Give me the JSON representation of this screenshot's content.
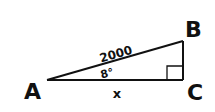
{
  "diagram": {
    "type": "right-triangle",
    "vertices": {
      "A": "A",
      "B": "B",
      "C": "C"
    },
    "hypotenuse_label": "2000",
    "angle_label": "8°",
    "base_label": "x",
    "right_angle_at": "C",
    "stroke_color": "#111111",
    "background": "#ffffff"
  }
}
